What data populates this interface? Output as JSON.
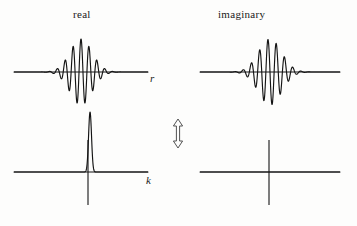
{
  "figure": {
    "background_color": "#fdfdfc",
    "ink_color": "#141414",
    "columns": [
      {
        "id": "real",
        "title": "real"
      },
      {
        "id": "imaginary",
        "title": "imaginary"
      }
    ],
    "rows": [
      {
        "id": "position-space",
        "axis_label": "r"
      },
      {
        "id": "momentum-space",
        "axis_label": "k"
      }
    ],
    "transform_arrow": {
      "name": "fourier-transform-double-arrow",
      "direction": "vertical-double-headed",
      "x": 178,
      "y_top": 120,
      "y_bottom": 148
    }
  },
  "chart_data": [
    {
      "id": "real-position",
      "type": "line",
      "title": "real",
      "xlabel": "r",
      "ylabel": "",
      "grid": false,
      "legend": null,
      "description": "Cosine-modulated Gaussian wave packet, even symmetry, maximum at r = 0",
      "axes": {
        "x_axis_y": 72,
        "x_min_px": 14,
        "x_max_px": 148,
        "baseline": 0
      },
      "envelope": {
        "form": "gaussian",
        "center": 0.0,
        "sigma": 0.165,
        "amplitude": 1.0
      },
      "carrier": {
        "form": "cosine",
        "wavelength": 0.118,
        "phase": 0.0
      },
      "xlim": [
        -1,
        1
      ],
      "ylim": [
        -1.05,
        1.05
      ],
      "x": [
        -1.0,
        -0.95,
        -0.9,
        -0.85,
        -0.8,
        -0.75,
        -0.7,
        -0.65,
        -0.6,
        -0.55,
        -0.5,
        -0.45,
        -0.4,
        -0.35,
        -0.3,
        -0.25,
        -0.2,
        -0.15,
        -0.1,
        -0.05,
        0.0,
        0.05,
        0.1,
        0.15,
        0.2,
        0.25,
        0.3,
        0.35,
        0.4,
        0.45,
        0.5,
        0.55,
        0.6,
        0.65,
        0.7,
        0.75,
        0.8,
        0.85,
        0.9,
        0.95,
        1.0
      ],
      "y": [
        0.0,
        0.0,
        -0.01,
        0.01,
        -0.02,
        0.04,
        -0.06,
        0.1,
        -0.16,
        0.24,
        -0.34,
        0.45,
        -0.57,
        0.68,
        -0.79,
        0.88,
        -0.95,
        0.99,
        -1.0,
        0.99,
        1.0,
        0.99,
        -1.0,
        0.99,
        -0.95,
        0.88,
        -0.79,
        0.68,
        -0.57,
        0.45,
        -0.34,
        0.24,
        -0.16,
        0.1,
        -0.06,
        0.04,
        -0.02,
        0.01,
        -0.01,
        0.0,
        0.0
      ]
    },
    {
      "id": "imaginary-position",
      "type": "line",
      "title": "imaginary",
      "xlabel": "",
      "ylabel": "",
      "grid": false,
      "legend": null,
      "description": "Sine-modulated Gaussian wave packet, odd symmetry, zero crossing at r = 0",
      "axes": {
        "x_axis_y": 72,
        "x_min_px": 200,
        "x_max_px": 340,
        "baseline": 0
      },
      "envelope": {
        "form": "gaussian",
        "center": 0.0,
        "sigma": 0.165,
        "amplitude": 1.0
      },
      "carrier": {
        "form": "sine",
        "wavelength": 0.118,
        "phase": 1.5708
      },
      "xlim": [
        -1,
        1
      ],
      "ylim": [
        -1.05,
        1.05
      ],
      "x": [
        -1.0,
        -0.95,
        -0.9,
        -0.85,
        -0.8,
        -0.75,
        -0.7,
        -0.65,
        -0.6,
        -0.55,
        -0.5,
        -0.45,
        -0.4,
        -0.35,
        -0.3,
        -0.25,
        -0.2,
        -0.15,
        -0.1,
        -0.05,
        0.0,
        0.05,
        0.1,
        0.15,
        0.2,
        0.25,
        0.3,
        0.35,
        0.4,
        0.45,
        0.5,
        0.55,
        0.6,
        0.65,
        0.7,
        0.75,
        0.8,
        0.85,
        0.9,
        0.95,
        1.0
      ],
      "y": [
        0.0,
        0.0,
        0.01,
        -0.01,
        0.02,
        -0.04,
        0.06,
        -0.1,
        0.16,
        -0.24,
        0.34,
        -0.45,
        0.57,
        -0.68,
        0.79,
        -0.88,
        0.95,
        -0.99,
        1.0,
        -0.99,
        0.0,
        0.99,
        -1.0,
        0.99,
        -0.95,
        0.88,
        -0.79,
        0.68,
        -0.57,
        0.45,
        -0.34,
        0.24,
        -0.16,
        0.1,
        -0.06,
        0.04,
        -0.02,
        0.01,
        -0.01,
        0.0,
        0.0
      ]
    },
    {
      "id": "real-momentum",
      "type": "line",
      "title": "",
      "xlabel": "k",
      "ylabel": "",
      "grid": false,
      "legend": null,
      "description": "Narrow Gaussian peak offset to the right of the origin; Fourier transform magnitude of the wave packet",
      "axes": {
        "x_axis_y": 172,
        "x_min_px": 14,
        "x_max_px": 148,
        "y_axis_x": 88,
        "y_top_px": 140,
        "y_bottom_px": 205
      },
      "peak": {
        "center": 0.135,
        "sigma": 0.022,
        "amplitude": 1.0,
        "height_px": 60
      },
      "xlim": [
        -1,
        1
      ],
      "ylim": [
        0,
        1.05
      ],
      "x": [
        -1.0,
        -0.5,
        -0.2,
        -0.1,
        -0.05,
        0.0,
        0.04,
        0.07,
        0.09,
        0.11,
        0.12,
        0.13,
        0.135,
        0.14,
        0.15,
        0.16,
        0.18,
        0.2,
        0.24,
        0.3,
        0.5,
        1.0
      ],
      "y": [
        0.0,
        0.0,
        0.0,
        0.0,
        0.0,
        0.0,
        0.0,
        0.01,
        0.05,
        0.38,
        0.68,
        0.94,
        1.0,
        0.94,
        0.68,
        0.38,
        0.05,
        0.01,
        0.0,
        0.0,
        0.0,
        0.0
      ]
    },
    {
      "id": "imaginary-momentum",
      "type": "line",
      "title": "",
      "xlabel": "",
      "ylabel": "",
      "grid": false,
      "legend": null,
      "description": "Identically zero; only the coordinate axes are drawn",
      "axes": {
        "x_axis_y": 172,
        "x_min_px": 200,
        "x_max_px": 340,
        "y_axis_x": 269,
        "y_top_px": 140,
        "y_bottom_px": 205
      },
      "xlim": [
        -1,
        1
      ],
      "ylim": [
        0,
        1.05
      ],
      "x": [
        -1.0,
        1.0
      ],
      "y": [
        0.0,
        0.0
      ]
    }
  ]
}
